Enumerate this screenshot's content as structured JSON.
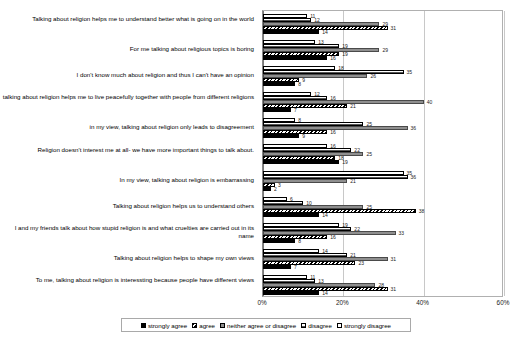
{
  "chart_data": {
    "type": "bar",
    "orientation": "horizontal",
    "title": "",
    "xlabel": "",
    "ylabel": "",
    "xlim": [
      0,
      60
    ],
    "xtick_labels": [
      "0%",
      "20%",
      "40%",
      "60%"
    ],
    "xtick_values": [
      0,
      20,
      40,
      60
    ],
    "grid": true,
    "legend_position": "bottom",
    "categories": [
      "Talking about religion helps me to understand better what is going on in the world",
      "For me talking about religious topics is boring",
      "I don't know much about religion and thus I can't have an opinion",
      "talking about religion helps me to live peacefully together with people from different religions",
      "in my view, talking about religion only leads to disagreement",
      "Religion doesn't interest me at all- we have more important things to talk about.",
      "In my view, talking about religion is embarrassing",
      "Talking about religion helps us to understand others",
      "I and my friends talk about how stupid religion is and what cruelties are carried out in its name",
      "Talking about religion helps to shape my own views",
      "To me, talking about religion is interessting because people have different views"
    ],
    "series": [
      {
        "name": "strongly agree",
        "fill": "solid-black",
        "color": "#000000",
        "values": [
          14,
          16,
          8,
          7,
          9,
          19,
          2,
          14,
          8,
          7,
          14
        ]
      },
      {
        "name": "agree",
        "fill": "diagonal-hatch",
        "color": "#ffffff",
        "values": [
          31,
          19,
          9,
          21,
          16,
          18,
          3,
          38,
          16,
          23,
          31
        ]
      },
      {
        "name": "neither agree or disagree",
        "fill": "solid-gray",
        "color": "#8f8f8f",
        "values": [
          29,
          29,
          26,
          40,
          36,
          25,
          21,
          25,
          33,
          31,
          28
        ]
      },
      {
        "name": "disagree",
        "fill": "horizontal-hatch",
        "color": "#ffffff",
        "values": [
          12,
          19,
          35,
          16,
          25,
          22,
          36,
          10,
          22,
          21,
          13
        ]
      },
      {
        "name": "strongly disagree",
        "fill": "white",
        "color": "#ffffff",
        "values": [
          11,
          13,
          18,
          12,
          8,
          16,
          35,
          6,
          19,
          14,
          11
        ]
      }
    ]
  }
}
